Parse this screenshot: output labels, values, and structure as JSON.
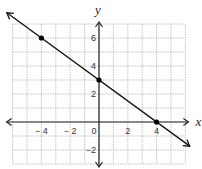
{
  "chart_data": {
    "type": "line",
    "title": "",
    "xlabel": "x",
    "ylabel": "y",
    "xlim": [
      -6,
      6
    ],
    "ylim": [
      -3,
      7
    ],
    "grid": true,
    "x_ticks": [
      -4,
      -2,
      0,
      2,
      4
    ],
    "x_tick_labels": [
      "− 4",
      "− 2",
      "0",
      "2",
      "4"
    ],
    "y_ticks": [
      6,
      4,
      2,
      -2
    ],
    "y_tick_labels": [
      "6",
      "4",
      "2",
      "−2"
    ],
    "series": [
      {
        "name": "line",
        "equation": "y = -3/4 x + 3",
        "slope": -0.75,
        "intercept": 3,
        "extends_both_directions": true,
        "x": [
          -6,
          6
        ],
        "y": [
          7.5,
          -1.5
        ]
      }
    ],
    "points": [
      {
        "x": -4,
        "y": 6
      },
      {
        "x": 0,
        "y": 3
      },
      {
        "x": 4,
        "y": 0
      }
    ],
    "colors": {
      "line": "#111111",
      "grid": "#b5b5b5",
      "axis": "#222222",
      "point": "#000000"
    }
  }
}
